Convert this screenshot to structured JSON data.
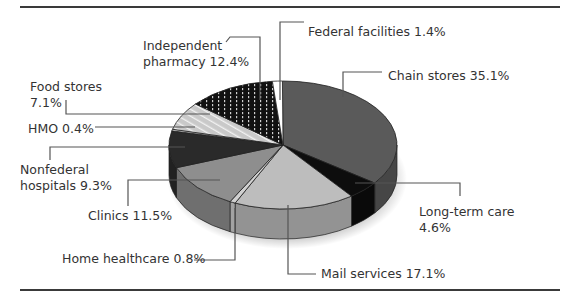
{
  "chart_data": {
    "type": "pie",
    "title": "",
    "style": "3d-exploded-grayscale",
    "legend": "none (leader-line labels)",
    "slices": [
      {
        "label": "Chain stores",
        "value": 35.1,
        "display": "Chain stores 35.1%",
        "color": "#5a5a5a"
      },
      {
        "label": "Long-term care",
        "value": 4.6,
        "display": "Long-term care 4.6%",
        "color": "#0d0d0d"
      },
      {
        "label": "Mail services",
        "value": 17.1,
        "display": "Mail services 17.1%",
        "color": "#bdbdbd"
      },
      {
        "label": "Home healthcare",
        "value": 0.8,
        "display": "Home healthcare 0.8%",
        "color": "#d0d0d0"
      },
      {
        "label": "Clinics",
        "value": 11.5,
        "display": "Clinics 11.5%",
        "color": "#8e8e8e"
      },
      {
        "label": "Nonfederal hospitals",
        "value": 9.3,
        "display": "Nonfederal hospitals 9.3%",
        "color": "#2a2a2a"
      },
      {
        "label": "HMO",
        "value": 0.4,
        "display": "HMO 0.4%",
        "color": "#e6e6e6"
      },
      {
        "label": "Food stores",
        "value": 7.1,
        "display": "Food stores 7.1%",
        "color": "#c8c8c8",
        "pattern": "hatched"
      },
      {
        "label": "Independent pharmacy",
        "value": 12.4,
        "display": "Independent pharmacy 12.4%",
        "color": "#111111",
        "pattern": "vertical-dotted"
      },
      {
        "label": "Federal facilities",
        "value": 1.4,
        "display": "Federal facilities 1.4%",
        "color": "#ffffff"
      }
    ]
  },
  "labels": {
    "federal_facilities": "Federal facilities 1.4%",
    "independent_line1": "Independent",
    "independent_line2": "pharmacy 12.4%",
    "chain_stores": "Chain stores 35.1%",
    "food_line1": "Food stores",
    "food_line2": "7.1%",
    "hmo": "HMO 0.4%",
    "nonfederal_line1": "Nonfederal",
    "nonfederal_line2": "hospitals 9.3%",
    "clinics": "Clinics 11.5%",
    "long_term_line1": "Long-term care",
    "long_term_line2": "4.6%",
    "home_healthcare": "Home healthcare 0.8%",
    "mail_services": "Mail services 17.1%"
  }
}
